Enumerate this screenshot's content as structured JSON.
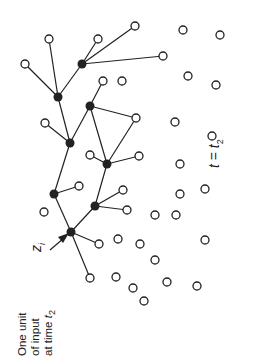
{
  "caption": {
    "line1": "One unit",
    "line2": "of input",
    "line3_prefix": "at time ",
    "line3_var": "t",
    "line3_sub": "2"
  },
  "input_label": {
    "var": "z",
    "sub": "i"
  },
  "time_label": {
    "var": "t",
    "eq": " = ",
    "var2": "t",
    "sub": "2"
  },
  "colors": {
    "stroke": "#222222",
    "filled": "#222222",
    "open_fill": "#ffffff"
  },
  "filled_nodes": [
    {
      "id": "A",
      "x": 58,
      "y": 97
    },
    {
      "id": "B",
      "x": 82,
      "y": 64
    },
    {
      "id": "C",
      "x": 70,
      "y": 143
    },
    {
      "id": "D",
      "x": 90,
      "y": 106
    },
    {
      "id": "E",
      "x": 54,
      "y": 194
    },
    {
      "id": "F",
      "x": 107,
      "y": 164
    },
    {
      "id": "G",
      "x": 95,
      "y": 206
    },
    {
      "id": "H",
      "x": 71,
      "y": 232
    }
  ],
  "open_nodes": [
    {
      "x": 49,
      "y": 39
    },
    {
      "x": 98,
      "y": 39
    },
    {
      "x": 135,
      "y": 26
    },
    {
      "x": 163,
      "y": 56
    },
    {
      "x": 25,
      "y": 64
    },
    {
      "x": 103,
      "y": 81
    },
    {
      "x": 122,
      "y": 81
    },
    {
      "x": 45,
      "y": 123
    },
    {
      "x": 136,
      "y": 118
    },
    {
      "x": 90,
      "y": 155
    },
    {
      "x": 139,
      "y": 156
    },
    {
      "x": 79,
      "y": 186
    },
    {
      "x": 123,
      "y": 190
    },
    {
      "x": 127,
      "y": 210
    },
    {
      "x": 44,
      "y": 212
    },
    {
      "x": 99,
      "y": 244
    },
    {
      "x": 118,
      "y": 239
    },
    {
      "x": 90,
      "y": 278
    },
    {
      "x": 116,
      "y": 277
    },
    {
      "x": 183,
      "y": 30
    },
    {
      "x": 220,
      "y": 35
    },
    {
      "x": 188,
      "y": 76
    },
    {
      "x": 216,
      "y": 85
    },
    {
      "x": 175,
      "y": 122
    },
    {
      "x": 212,
      "y": 136
    },
    {
      "x": 180,
      "y": 164
    },
    {
      "x": 180,
      "y": 194
    },
    {
      "x": 205,
      "y": 189
    },
    {
      "x": 155,
      "y": 215
    },
    {
      "x": 176,
      "y": 215
    },
    {
      "x": 140,
      "y": 244
    },
    {
      "x": 205,
      "y": 240
    },
    {
      "x": 133,
      "y": 288
    },
    {
      "x": 167,
      "y": 282
    },
    {
      "x": 155,
      "y": 260
    },
    {
      "x": 144,
      "y": 301
    },
    {
      "x": 197,
      "y": 286
    }
  ],
  "edges": [
    [
      "A",
      "B"
    ],
    [
      "A",
      "C"
    ],
    [
      "C",
      "E"
    ],
    [
      "E",
      "H"
    ],
    [
      "C",
      "D"
    ],
    [
      "D",
      "F"
    ],
    [
      "F",
      "G"
    ],
    [
      "G",
      "H"
    ],
    [
      "D",
      [
        136,
        118
      ]
    ],
    [
      "F",
      [
        136,
        118
      ]
    ]
  ],
  "open_edges": [
    [
      "A",
      [
        49,
        39
      ]
    ],
    [
      "A",
      [
        25,
        64
      ]
    ],
    [
      "B",
      [
        98,
        39
      ]
    ],
    [
      "B",
      [
        135,
        26
      ]
    ],
    [
      "B",
      [
        163,
        56
      ]
    ],
    [
      "D",
      [
        103,
        81
      ]
    ],
    [
      "C",
      [
        45,
        123
      ]
    ],
    [
      "F",
      [
        90,
        155
      ]
    ],
    [
      "F",
      [
        139,
        156
      ]
    ],
    [
      "E",
      [
        79,
        186
      ]
    ],
    [
      "G",
      [
        123,
        190
      ]
    ],
    [
      "G",
      [
        127,
        210
      ]
    ],
    [
      "H",
      [
        99,
        244
      ]
    ],
    [
      "H",
      [
        90,
        278
      ]
    ]
  ]
}
